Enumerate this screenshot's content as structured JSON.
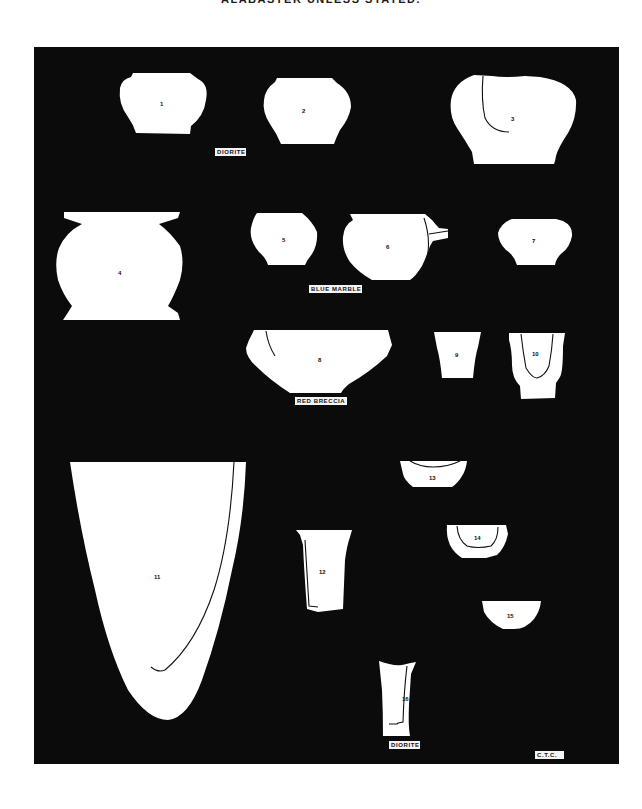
{
  "page": {
    "caption": "ALABASTER UNLESS STATED."
  },
  "plate": {
    "background_color": "#0b0b0b",
    "vessel_color": "#ffffff",
    "vessels": [
      {
        "number": "1",
        "shape": "squat jar"
      },
      {
        "number": "2",
        "shape": "squat jar"
      },
      {
        "number": "3",
        "shape": "shouldered jar with section line"
      },
      {
        "number": "4",
        "shape": "flared rim jar"
      },
      {
        "number": "5",
        "shape": "small jar"
      },
      {
        "number": "6",
        "shape": "spouted jar"
      },
      {
        "number": "7",
        "shape": "small jar"
      },
      {
        "number": "8",
        "shape": "bowl"
      },
      {
        "number": "9",
        "shape": "beaker"
      },
      {
        "number": "10",
        "shape": "cup with section line"
      },
      {
        "number": "11",
        "shape": "large conical vessel"
      },
      {
        "number": "12",
        "shape": "cylindrical vase"
      },
      {
        "number": "13",
        "shape": "shallow bowl"
      },
      {
        "number": "14",
        "shape": "bowl with section line"
      },
      {
        "number": "15",
        "shape": "hemispherical bowl"
      },
      {
        "number": "16",
        "shape": "flared vase"
      }
    ],
    "material_labels": [
      {
        "text": "DIORITE",
        "refers_to": "2"
      },
      {
        "text": "BLUE MARBLE",
        "refers_to": "6"
      },
      {
        "text": "RED BRECCIA",
        "refers_to": "8"
      },
      {
        "text": "DIORITE",
        "refers_to": "16"
      }
    ],
    "signature": "C.T.C."
  }
}
